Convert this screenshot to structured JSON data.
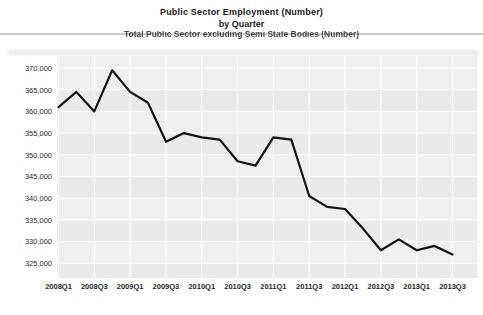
{
  "title": {
    "line1": "Public Sector Employment  (Number)",
    "line2": "by Quarter",
    "line3": "Total Public Sector excluding Semi State Bodies (Number)"
  },
  "chart_data": {
    "type": "line",
    "title": "Public Sector Employment  (Number)",
    "subtitle": "by Quarter",
    "series": [
      {
        "name": "Total Public Sector excluding Semi State Bodies (Number)",
        "values": [
          361000,
          364500,
          360000,
          369500,
          364500,
          362000,
          353000,
          355000,
          354000,
          353500,
          348500,
          347500,
          354000,
          353500,
          340500,
          338000,
          337500,
          333000,
          328000,
          330500,
          328000,
          329000,
          327000
        ]
      }
    ],
    "x": [
      "2008Q1",
      "2008Q2",
      "2008Q3",
      "2008Q4",
      "2009Q1",
      "2009Q2",
      "2009Q3",
      "2009Q4",
      "2010Q1",
      "2010Q2",
      "2010Q3",
      "2010Q4",
      "2011Q1",
      "2011Q2",
      "2011Q3",
      "2011Q4",
      "2012Q1",
      "2012Q2",
      "2012Q3",
      "2012Q4",
      "2013Q1",
      "2013Q2",
      "2013Q3"
    ],
    "x_tick_labels": [
      "2008Q1",
      "2008Q3",
      "2009Q1",
      "2009Q3",
      "2010Q1",
      "2010Q3",
      "2011Q1",
      "2011Q3",
      "2012Q1",
      "2012Q3",
      "2013Q1",
      "2013Q3"
    ],
    "y_ticks": [
      325000,
      330000,
      335000,
      340000,
      345000,
      350000,
      355000,
      360000,
      365000,
      370000
    ],
    "ylim": [
      325000,
      370000
    ],
    "xlabel": "",
    "ylabel": "",
    "legend": "none",
    "grid": "on",
    "line_color": "#141414",
    "plot_bg_color": "#efefef",
    "plot_band_color": "#eaeaea",
    "grid_color": "#ffffff",
    "tick_label_color": "#1f1f1f"
  }
}
